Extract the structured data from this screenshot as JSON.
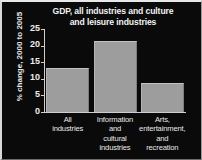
{
  "chart_data": {
    "type": "bar",
    "title": "GDP, all industries and culture and leisure industries",
    "title_lines": [
      "GDP, all industries and culture",
      "and leisure industries"
    ],
    "xlabel": "",
    "ylabel": "% change, 2000 to 2005",
    "ylim": [
      0,
      25
    ],
    "yticks": [
      0,
      5,
      10,
      15,
      20,
      25
    ],
    "ytick_labels": [
      "0",
      "5",
      "10",
      "15",
      "20",
      "25"
    ],
    "grid": false,
    "legend": false,
    "categories": [
      "All industries",
      "Information and cultural industries",
      "Arts, entertainment, and recreation"
    ],
    "category_lines": [
      [
        "All",
        "industries"
      ],
      [
        "Information",
        "and",
        "cultural",
        "industries"
      ],
      [
        "Arts,",
        "entertainment,",
        "and",
        "recreation"
      ]
    ],
    "values": [
      13.3,
      21.5,
      8.8
    ],
    "bar_color": "#9d9d9d",
    "background_color": "#0a0a0a",
    "text_color": "#eeeeee"
  }
}
